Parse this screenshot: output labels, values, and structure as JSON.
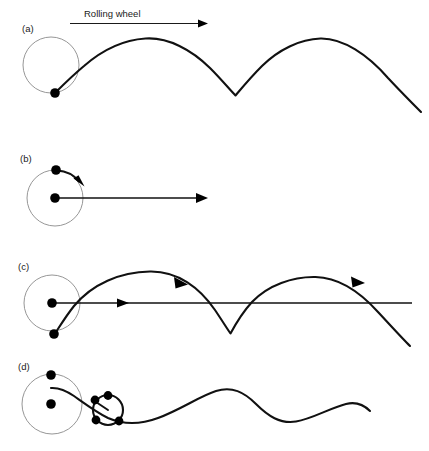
{
  "figure": {
    "title_annotation": "Rolling wheel",
    "background_color": "#ffffff",
    "curve_color": "#111111",
    "wheel_outline_color": "#8a8a8a",
    "panels": [
      {
        "id": "a",
        "label": "(a)",
        "caption_hidden": "Common cycloid traced by a point on the wheel rim",
        "wheel": {
          "cx": 51,
          "cy": 65,
          "r": 28
        },
        "tracing_point": {
          "cx": 55,
          "cy": 93,
          "r": 4.6
        },
        "curve_type": "cycloid",
        "cusps": [
          235
        ],
        "peaks": [
          145,
          330
        ]
      },
      {
        "id": "b",
        "label": "(b)",
        "caption_hidden": "Wheel with rotation arrow and translation arrow",
        "wheel": {
          "cx": 55,
          "cy": 198,
          "r": 28
        },
        "center_point": {
          "cx": 55,
          "cy": 198,
          "r": 4.6
        },
        "rim_point": {
          "cx": 56,
          "cy": 170,
          "r": 4.6
        },
        "translation_arrow": {
          "x1": 55,
          "y1": 198,
          "x2": 207,
          "y2": 198
        },
        "rotation_arrow": "clockwise"
      },
      {
        "id": "c",
        "label": "(c)",
        "caption_hidden": "Curtate/prolate cycloid with direction arrows and axis",
        "wheel": {
          "cx": 52,
          "cy": 303,
          "r": 28
        },
        "center_point": {
          "cx": 52,
          "cy": 303,
          "r": 4.6
        },
        "tracing_point": {
          "cx": 54,
          "cy": 334,
          "r": 4.6
        },
        "axis_line": {
          "x1": 52,
          "y1": 303,
          "x2": 412,
          "y2": 303
        },
        "curve_type": "prolate-cycloid",
        "cusps": [
          230
        ],
        "peaks": [
          150,
          315
        ]
      },
      {
        "id": "d",
        "label": "(d)",
        "caption_hidden": "Curtate cycloid from interior point, wave-like trace",
        "wheel": {
          "cx": 52,
          "cy": 404,
          "r": 30
        },
        "center_point": {
          "cx": 51,
          "cy": 404,
          "r": 4.6
        },
        "interior_point": {
          "cx": 51,
          "cy": 375,
          "r": 4.6
        },
        "small_wheel": {
          "cx": 108,
          "cy": 410,
          "r": 16
        },
        "curve_type": "curtate-cycloid-wave",
        "peaks": [
          230
        ],
        "troughs": [
          315
        ]
      }
    ]
  }
}
